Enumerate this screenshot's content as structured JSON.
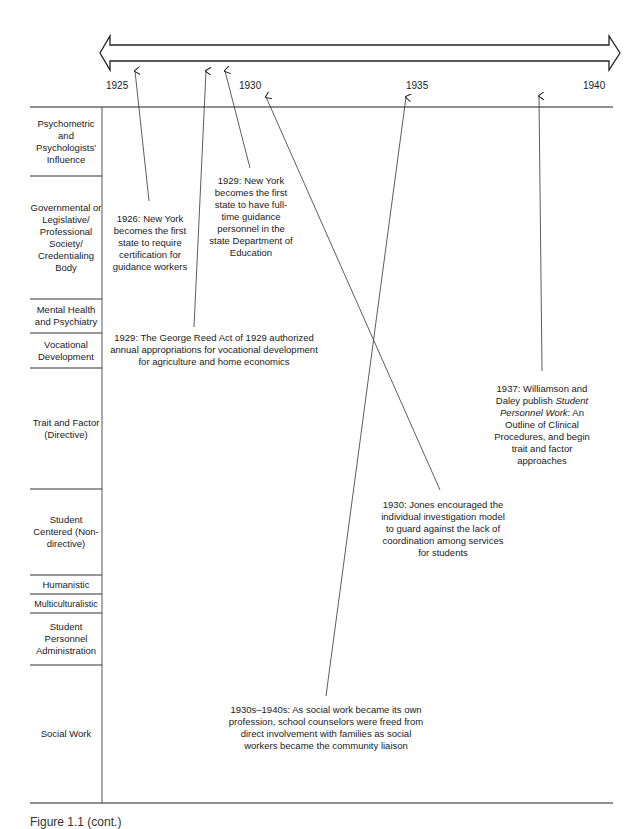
{
  "timeline": {
    "years": [
      "1925",
      "1930",
      "1935",
      "1940"
    ]
  },
  "categories": [
    {
      "label": "Psychometric and Psychologists' Influence"
    },
    {
      "label": "Governmental or Legislative/ Professional Society/ Credentialing Body"
    },
    {
      "label": "Mental Health and Psychiatry"
    },
    {
      "label": "Vocational Development"
    },
    {
      "label": "Trait and Factor (Directive)"
    },
    {
      "label": "Student Centered (Non-directive)"
    },
    {
      "label": "Humanistic"
    },
    {
      "label": "Multiculturalistic"
    },
    {
      "label": "Student Personnel Administration"
    },
    {
      "label": "Social Work"
    }
  ],
  "events": [
    {
      "text": "1926: New York becomes the first state to require certification for guidance workers"
    },
    {
      "text": "1929: New York becomes the first state to have full-time guidance personnel in the state Department of Education"
    },
    {
      "text": "1929: The George Reed Act of 1929 authorized annual appropriations for vocational development for agriculture and home economics"
    },
    {
      "text_pre": "1937: Williamson and Daley publish ",
      "text_italic": "Student Personnel Work",
      "text_post": ": An Outline of Clinical Procedures, and begin trait and factor approaches"
    },
    {
      "text": "1930: Jones encouraged the individual investigation model to guard against the lack of coordination among services for students"
    },
    {
      "text": "1930s–1940s: As social work became its own profession, school counselors were freed from direct involvement with families as social workers became the community liaison"
    }
  ],
  "caption": "Figure 1.1 (cont.)"
}
